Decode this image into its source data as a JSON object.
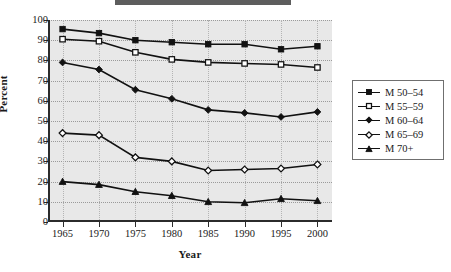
{
  "chart_data": {
    "type": "line",
    "title": "",
    "xlabel": "Year",
    "ylabel": "Percent",
    "x": [
      1965,
      1970,
      1975,
      1980,
      1985,
      1990,
      1995,
      2000
    ],
    "xticklabels": [
      "1965",
      "1970",
      "1975",
      "1980",
      "1985",
      "1990",
      "1995",
      "2000"
    ],
    "yticklabels": [
      "0",
      "10",
      "20",
      "30",
      "40",
      "50",
      "60",
      "70",
      "80",
      "90",
      "100"
    ],
    "yticks": [
      0,
      10,
      20,
      30,
      40,
      50,
      60,
      70,
      80,
      90,
      100
    ],
    "xlim": [
      1963,
      2002
    ],
    "ylim": [
      0,
      100
    ],
    "grid": "horizontal-and-vertical-dotted",
    "legend_position": "right-outside",
    "series": [
      {
        "name": "M 50–54",
        "marker": "filled-square",
        "values": [
          95.5,
          93.5,
          90.0,
          89.0,
          88.0,
          88.0,
          85.5,
          87.0
        ]
      },
      {
        "name": "M 55–59",
        "marker": "open-square",
        "values": [
          90.5,
          89.5,
          84.0,
          80.5,
          79.0,
          78.5,
          78.0,
          76.5
        ]
      },
      {
        "name": "M 60–64",
        "marker": "filled-diamond",
        "values": [
          79.0,
          75.5,
          65.5,
          61.0,
          55.5,
          54.0,
          52.0,
          54.5
        ]
      },
      {
        "name": "M 65–69",
        "marker": "open-diamond",
        "values": [
          44.0,
          43.0,
          32.0,
          30.0,
          25.5,
          26.0,
          26.5,
          28.5
        ]
      },
      {
        "name": "M 70+",
        "marker": "filled-triangle",
        "values": [
          20.0,
          18.5,
          15.0,
          13.0,
          10.0,
          9.5,
          11.5,
          10.5
        ]
      }
    ],
    "colors": {
      "line": "#111111",
      "plot_background": "#e8e8e8",
      "grid": "#9a9a9a",
      "axis": "#2b2b2b",
      "text": "#1a1a1a"
    }
  },
  "legend": {
    "items": [
      {
        "label": "M 50–54"
      },
      {
        "label": "M 55–59"
      },
      {
        "label": "M 60–64"
      },
      {
        "label": "M 65–69"
      },
      {
        "label": "M 70+"
      }
    ]
  }
}
